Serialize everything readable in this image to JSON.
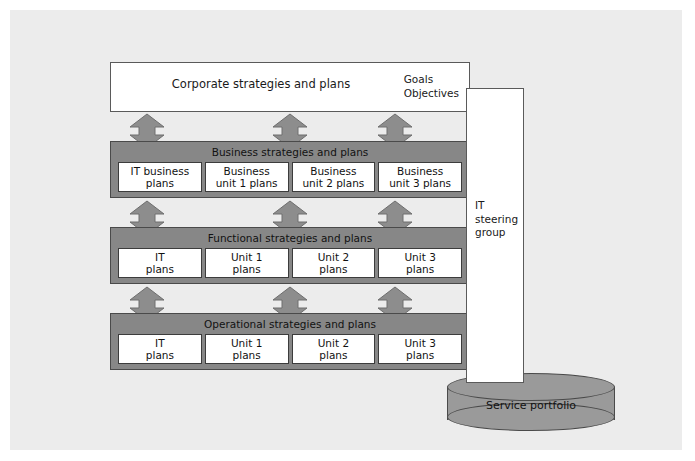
{
  "diagram": {
    "corporate": {
      "title": "Corporate strategies and plans",
      "goals_line1": "Goals",
      "goals_line2": "Objectives"
    },
    "bands": [
      {
        "title": "Business strategies and plans",
        "cells": [
          {
            "line1": "IT business",
            "line2": "plans"
          },
          {
            "line1": "Business",
            "line2": "unit 1 plans"
          },
          {
            "line1": "Business",
            "line2": "unit 2 plans"
          },
          {
            "line1": "Business",
            "line2": "unit 3 plans"
          }
        ]
      },
      {
        "title": "Functional strategies and plans",
        "cells": [
          {
            "line1": "IT",
            "line2": "plans"
          },
          {
            "line1": "Unit 1",
            "line2": "plans"
          },
          {
            "line1": "Unit 2",
            "line2": "plans"
          },
          {
            "line1": "Unit 3",
            "line2": "plans"
          }
        ]
      },
      {
        "title": "Operational strategies and plans",
        "cells": [
          {
            "line1": "IT",
            "line2": "plans"
          },
          {
            "line1": "Unit 1",
            "line2": "plans"
          },
          {
            "line1": "Unit 2",
            "line2": "plans"
          },
          {
            "line1": "Unit 3",
            "line2": "plans"
          }
        ]
      }
    ],
    "steering_group": {
      "line1": "IT",
      "line2": "steering",
      "line3": "group"
    },
    "service_portfolio": {
      "label": "Service portfolio"
    },
    "colors": {
      "canvas": "#ececec",
      "band_fill": "#878787",
      "arrow_fill": "#8d8d8d",
      "cylinder_fill": "#9a9a9a",
      "outline": "#4a4a4a",
      "box_fill": "#ffffff"
    }
  }
}
